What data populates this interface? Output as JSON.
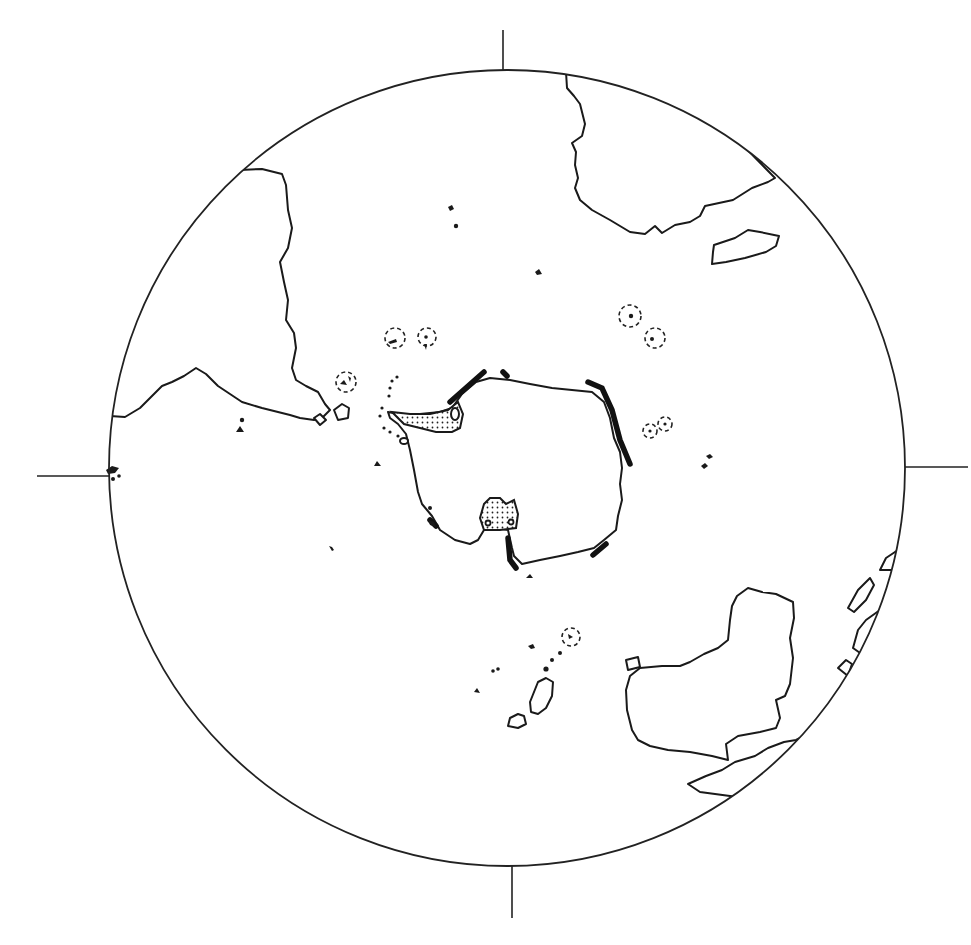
{
  "map": {
    "type": "polar-projection-outline",
    "projection_center": "South Pole",
    "width": 971,
    "height": 945,
    "colors": {
      "ink": "#1a1a1a",
      "background": "#ffffff"
    },
    "globe": {
      "cx": 507,
      "cy": 468,
      "r": 398
    },
    "axis_ticks": [
      {
        "name": "top",
        "x1": 503,
        "y1": 30,
        "x2": 503,
        "y2": 70
      },
      {
        "name": "bottom",
        "x1": 512,
        "y1": 866,
        "x2": 512,
        "y2": 918
      },
      {
        "name": "left",
        "x1": 37,
        "y1": 476,
        "x2": 109,
        "y2": 476
      },
      {
        "name": "right",
        "x1": 905,
        "y1": 467,
        "x2": 968,
        "y2": 467
      }
    ],
    "landmasses": [
      "Antarctica",
      "South America",
      "Africa",
      "Madagascar",
      "Australia",
      "New Zealand",
      "New Guinea / Indonesia fragments"
    ],
    "legend_features": [
      "stippled regions (ice shelves)",
      "heavy black bars (coastal features)",
      "dashed circles (highlighted islands)",
      "black dots (small islands)"
    ],
    "labels": []
  }
}
